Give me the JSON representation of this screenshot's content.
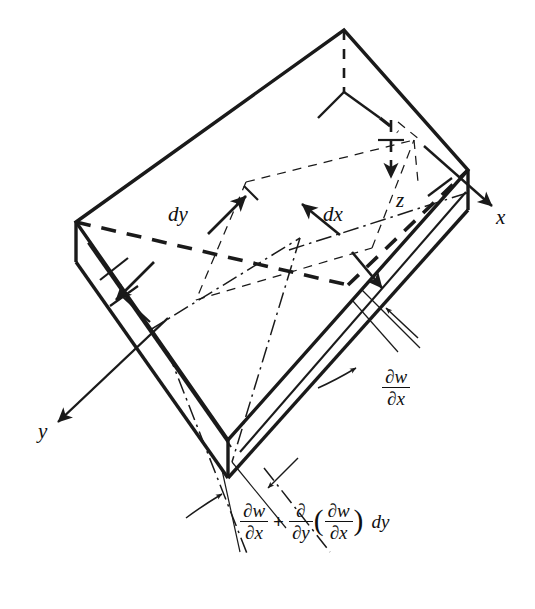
{
  "figure": {
    "kind": "engineering-diagram",
    "width": 535,
    "height": 609,
    "background_color": "#ffffff",
    "ink_color": "#1a1a1a"
  },
  "axes": [
    {
      "name": "x-axis",
      "label": "x",
      "label_x": 496,
      "label_y": 218,
      "direction": "down-right"
    },
    {
      "name": "y-axis",
      "label": "y",
      "label_x": 38,
      "label_y": 432,
      "direction": "down-left"
    },
    {
      "name": "z-axis",
      "label": "z",
      "label_x": 396,
      "label_y": 200,
      "direction": "down"
    }
  ],
  "dimensions": [
    {
      "name": "dy",
      "label": "dy",
      "label_x": 168,
      "label_y": 215,
      "arrow_style": "double-headed"
    },
    {
      "name": "dx",
      "label": "dx",
      "label_x": 323,
      "label_y": 215,
      "arrow_style": "double-headed"
    }
  ],
  "slope_label_right": {
    "name": "slope-dwdx",
    "numerator": "∂w",
    "denominator": "∂x",
    "x": 382,
    "y": 382
  },
  "slope_label_bottom": {
    "name": "slope-dwdx-plus-increment",
    "term1": {
      "numerator": "∂w",
      "denominator": "∂x"
    },
    "operator": "+",
    "term2": {
      "numerator": "∂",
      "denominator": "∂y"
    },
    "paren_open": "(",
    "term3": {
      "numerator": "∂w",
      "denominator": "∂x"
    },
    "paren_close": ")",
    "tail": "dy",
    "x": 240,
    "y": 523
  },
  "geometry": {
    "note": "isometric plate element: top face, two visible side faces, hidden back edges dashed, mid-surface dash-dot centerlines",
    "vertices": {
      "top_apex": [
        344,
        30
      ],
      "left_corner": [
        76,
        222
      ],
      "right_corner": [
        468,
        170
      ],
      "front_corner": [
        228,
        440
      ],
      "left_bottom": [
        76,
        262
      ],
      "right_bottom": [
        468,
        210
      ],
      "front_bottom": [
        228,
        478
      ]
    },
    "line_styles": {
      "visible_edge": "solid",
      "hidden_edge": "dashed",
      "centerline": "dash-dot",
      "leader": "thin-solid",
      "reference": "thin-dashed"
    }
  }
}
